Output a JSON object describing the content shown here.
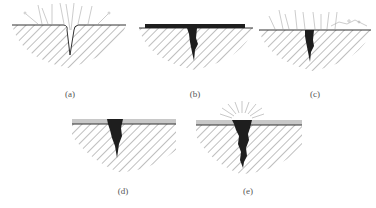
{
  "figure": {
    "panels": [
      {
        "id": "a",
        "label": "(a)",
        "description": "Open crack in surface with light rays/liquid entering"
      },
      {
        "id": "b",
        "label": "(b)",
        "description": "Penetrant layer on surface filling the crack"
      },
      {
        "id": "c",
        "label": "(c)",
        "description": "Excess surface penetrant removed, penetrant remains in crack"
      },
      {
        "id": "d",
        "label": "(d)",
        "description": "Developer layer applied over surface and crack"
      },
      {
        "id": "e",
        "label": "(e)",
        "description": "Penetrant bleeds out through developer producing visible indication"
      }
    ],
    "caption": "",
    "colors": {
      "hatch": "#8a8a8a",
      "surface_line": "#333333",
      "penetrant": "#1e1e1e",
      "developer": "#c8c8c8",
      "rays": "#b0b0b0"
    }
  }
}
